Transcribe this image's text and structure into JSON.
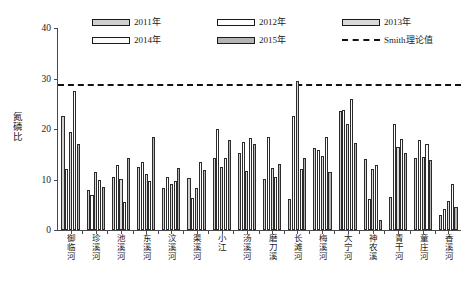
{
  "chart_data": {
    "type": "bar",
    "title": "",
    "xlabel": "",
    "ylabel": "氮磷比",
    "ylim": [
      0,
      40
    ],
    "yticks": [
      0,
      10,
      20,
      30,
      40
    ],
    "grid": false,
    "legend_position": "top",
    "categories": [
      "御临河",
      "珍溪河",
      "池溪河",
      "东溪河",
      "汶溪河",
      "渠溪河",
      "小江",
      "汤溪河",
      "磨刀溪",
      "长滩河",
      "梅溪河",
      "大宁河",
      "神农溪",
      "青干河",
      "童庄河",
      "香溪河"
    ],
    "series": [
      {
        "name": "2011年",
        "color": "#cfcfcf",
        "values": [
          22.5,
          8.0,
          10.5,
          12.5,
          8.3,
          10.3,
          14.3,
          15.2,
          10.2,
          6.2,
          16.2,
          23.5,
          14.0,
          6.5,
          14.3,
          3.0
        ]
      },
      {
        "name": "2012年",
        "color": "#ffffff",
        "values": [
          12.0,
          7.0,
          12.8,
          13.5,
          10.5,
          6.3,
          20.0,
          17.5,
          18.5,
          22.5,
          15.8,
          23.8,
          6.2,
          21.0,
          17.8,
          4.2
        ]
      },
      {
        "name": "2013年",
        "color": "#d9d9d9",
        "values": [
          19.5,
          11.5,
          10.2,
          11.0,
          9.2,
          8.3,
          12.5,
          11.6,
          12.2,
          29.5,
          14.7,
          21.0,
          12.0,
          16.5,
          14.5,
          5.8
        ]
      },
      {
        "name": "2014年",
        "color": "#fbfbfb",
        "values": [
          27.5,
          10.0,
          5.5,
          9.7,
          9.8,
          13.5,
          14.3,
          18.3,
          10.5,
          12.0,
          18.5,
          26.0,
          12.8,
          18.0,
          17.0,
          9.2
        ]
      },
      {
        "name": "2015年",
        "color": "#b4b4b4",
        "values": [
          17.0,
          8.5,
          14.3,
          18.5,
          12.2,
          11.8,
          17.8,
          17.0,
          13.0,
          14.3,
          11.5,
          17.2,
          2.0,
          15.3,
          13.8,
          4.5
        ]
      }
    ],
    "reference_line": {
      "label": "Smith理论值",
      "value": 29,
      "style": "dashed",
      "color": "#111111"
    }
  },
  "legend": {
    "entries": [
      {
        "label": "2011年",
        "kind": "swatch",
        "cls": "f2011"
      },
      {
        "label": "2012年",
        "kind": "swatch",
        "cls": "f2012"
      },
      {
        "label": "2013年",
        "kind": "swatch",
        "cls": "f2013"
      },
      {
        "label": "2014年",
        "kind": "swatch",
        "cls": "f2014"
      },
      {
        "label": "2015年",
        "kind": "swatch",
        "cls": "f2015"
      },
      {
        "label": "Smith理论值",
        "kind": "dash",
        "cls": "dashline"
      }
    ]
  },
  "yaxis": {
    "label_chars": [
      "氮",
      "磷",
      "比"
    ],
    "ticks": [
      "40",
      "30",
      "20",
      "10",
      "0"
    ]
  }
}
